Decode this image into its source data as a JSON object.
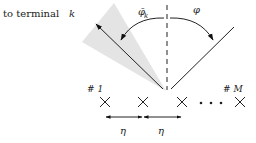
{
  "diagram": {
    "title_text": "to terminal",
    "title_var": "k",
    "angle_left": {
      "symbol": "φ̄",
      "subscript": "k"
    },
    "angle_right": {
      "symbol": "φ"
    },
    "elements": [
      {
        "label": "# 1"
      },
      {
        "label": ""
      },
      {
        "label": ""
      },
      {
        "label": "# M"
      }
    ],
    "ellipsis": "· · ·",
    "spacing_labels": [
      "η",
      "η"
    ],
    "colors": {
      "stroke": "#222222",
      "wedge": "#e4e4e4"
    }
  }
}
